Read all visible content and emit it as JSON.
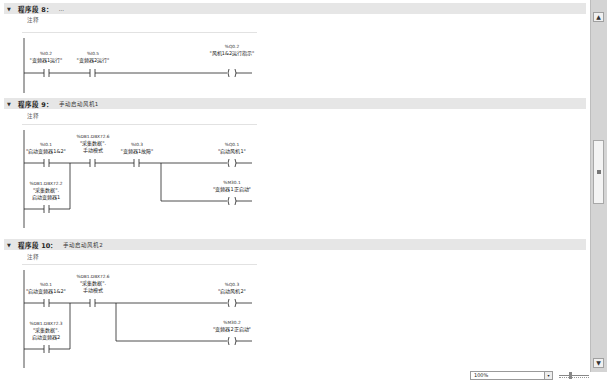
{
  "networks": [
    {
      "title": "程序段 8：",
      "subtitle": "...",
      "comment": "注释",
      "contacts": [
        {
          "address": "%I0.2",
          "name": "\"变频器1运行\""
        },
        {
          "address": "%I0.5",
          "name": "\"变频器2运行\""
        }
      ],
      "coils": [
        {
          "address": "%Q0.2",
          "name": "\"风机1&2运行指示\""
        }
      ]
    },
    {
      "title": "程序段 9：",
      "subtitle": "手动启动风机1",
      "comment": "注释",
      "contacts": [
        {
          "address": "%I0.1",
          "name": "\"启动变频器1&2\""
        },
        {
          "address": "%DB1.DBX72.6",
          "name": "\"采集数据\".",
          "name2": "手动模式"
        },
        {
          "address": "%I0.3",
          "name": "\"变频器1故障\""
        },
        {
          "address": "%DB1.DBX72.2",
          "name": "\"采集数据\".",
          "name2": "启动变频器1"
        }
      ],
      "coils": [
        {
          "address": "%Q0.1",
          "name": "\"启动风机1\""
        },
        {
          "address": "%M30.1",
          "name": "\"变频器1正启动\""
        }
      ]
    },
    {
      "title": "程序段 10：",
      "subtitle": "手动启动风机2",
      "comment": "注释",
      "contacts": [
        {
          "address": "%I0.1",
          "name": "\"启动变频器1&2\""
        },
        {
          "address": "%DB1.DBX72.6",
          "name": "\"采集数据\".",
          "name2": "手动模式"
        },
        {
          "address": "%DB1.DBX72.3",
          "name": "\"采集数据\".",
          "name2": "启动变频器2"
        }
      ],
      "coils": [
        {
          "address": "%Q0.3",
          "name": "\"启动风机2\""
        },
        {
          "address": "%M30.2",
          "name": "\"变频器2正启动\""
        }
      ]
    }
  ],
  "statusbar": {
    "zoom_level": "100%"
  },
  "icons": {
    "collapse": "▼",
    "scroll_up": "▲",
    "scroll_down": "▼",
    "dropdown": "▾"
  }
}
